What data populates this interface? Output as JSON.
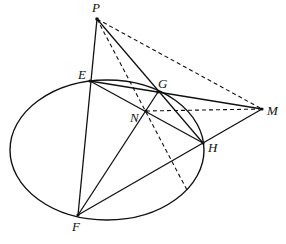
{
  "diagram": {
    "type": "geometry",
    "ellipse": {
      "cx": 107,
      "cy": 150,
      "rx": 97,
      "ry": 70
    },
    "points": {
      "P": {
        "label": "P",
        "x": 97,
        "y": 19
      },
      "E": {
        "label": "E",
        "x": 90,
        "y": 81
      },
      "G": {
        "label": "G",
        "x": 158,
        "y": 92
      },
      "N": {
        "label": "N",
        "x": 146,
        "y": 111
      },
      "M": {
        "label": "M",
        "x": 262,
        "y": 109
      },
      "H": {
        "label": "H",
        "x": 203,
        "y": 143
      },
      "F": {
        "label": "F",
        "x": 78,
        "y": 215
      }
    },
    "solid_segments": [
      [
        "P",
        "F"
      ],
      [
        "P",
        "H"
      ],
      [
        "E",
        "M"
      ],
      [
        "E",
        "H"
      ],
      [
        "F",
        "G"
      ],
      [
        "F",
        "M"
      ]
    ],
    "dashed_segments": [
      [
        "P",
        "M"
      ],
      [
        "N",
        "M"
      ],
      [
        "P",
        "Q"
      ]
    ],
    "extra_points": {
      "Q": {
        "x": 188,
        "y": 192
      }
    }
  }
}
